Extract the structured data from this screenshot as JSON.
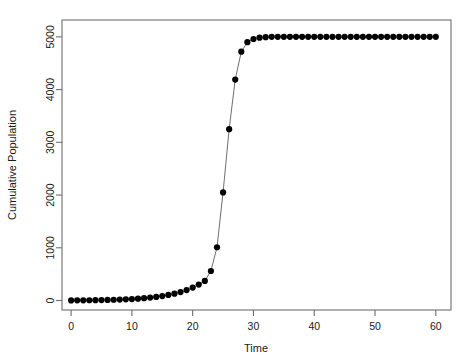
{
  "chart_data": {
    "type": "scatter",
    "title": "",
    "xlabel": "Time",
    "ylabel": "Cumulative Population",
    "xlim": [
      -1.5,
      62.5
    ],
    "ylim": [
      -180,
      5320
    ],
    "xticks": [
      0,
      10,
      20,
      30,
      40,
      50,
      60
    ],
    "yticks": [
      0,
      1000,
      2000,
      3000,
      4000,
      5000
    ],
    "xtick_labels": [
      "0",
      "10",
      "20",
      "30",
      "40",
      "50",
      "60"
    ],
    "ytick_labels": [
      "0",
      "1000",
      "2000",
      "3000",
      "4000",
      "5000"
    ],
    "grid": false,
    "legend": null,
    "marker": "filled-circle",
    "marker_color": "#000000",
    "line_color": "#555555",
    "box_color": "#6e6e6e",
    "background": "#ffffff",
    "series": [
      {
        "name": "Cumulative Population",
        "x": [
          0,
          1,
          2,
          3,
          4,
          5,
          6,
          7,
          8,
          9,
          10,
          11,
          12,
          13,
          14,
          15,
          16,
          17,
          18,
          19,
          20,
          21,
          22,
          23,
          24,
          25,
          26,
          27,
          28,
          29,
          30,
          31,
          32,
          33,
          34,
          35,
          36,
          37,
          38,
          39,
          40,
          41,
          42,
          43,
          44,
          45,
          46,
          47,
          48,
          49,
          50,
          51,
          52,
          53,
          54,
          55,
          56,
          57,
          58,
          59,
          60
        ],
        "values": [
          2,
          3,
          4,
          5,
          7,
          9,
          11,
          14,
          18,
          23,
          28,
          35,
          44,
          55,
          68,
          85,
          105,
          130,
          160,
          198,
          245,
          302,
          372,
          560,
          1010,
          2050,
          3250,
          4190,
          4720,
          4900,
          4960,
          4985,
          4995,
          5000,
          5000,
          5000,
          5000,
          5000,
          5000,
          5000,
          5000,
          5000,
          5000,
          5000,
          5000,
          5000,
          5000,
          5000,
          5000,
          5000,
          5000,
          5000,
          5000,
          5000,
          5000,
          5000,
          5000,
          5000,
          5000,
          5000,
          5000
        ]
      }
    ]
  },
  "geometry": {
    "plot_left": 62,
    "plot_right": 451,
    "plot_top": 20,
    "plot_bottom": 310
  }
}
